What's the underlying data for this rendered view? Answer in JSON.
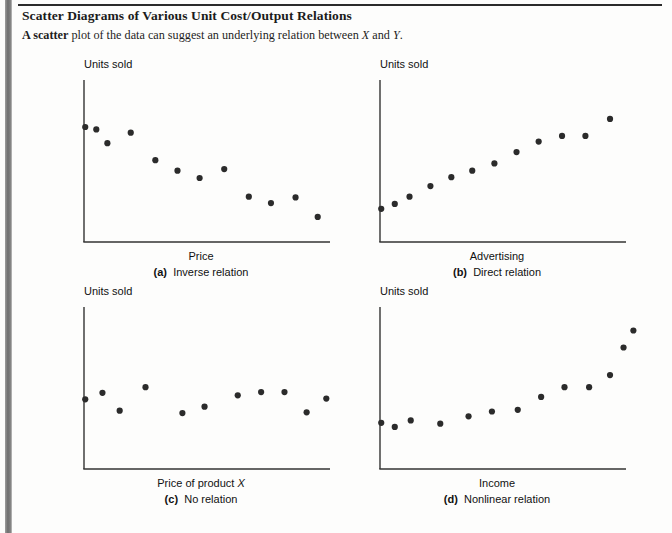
{
  "header": {
    "title": "Scatter Diagrams of Various Unit Cost/Output Relations",
    "subtitle_bold": "A scatter",
    "subtitle_rest_1": " plot of the data can suggest an underlying relation between ",
    "subtitle_var_x": "X",
    "subtitle_rest_2": " and ",
    "subtitle_var_y": "Y",
    "subtitle_end": "."
  },
  "charts": [
    {
      "key": "a",
      "panel_label": "(a)",
      "caption": "Inverse relation",
      "ylabel": "Units sold",
      "xlabel": "Price",
      "xlabel_italic_suffix": "",
      "chart_data": {
        "type": "scatter",
        "title": "(a) Inverse relation",
        "xlabel": "Price",
        "ylabel": "Units sold",
        "xlim": [
          0,
          100
        ],
        "ylim": [
          0,
          100
        ],
        "grid": false,
        "legend": "none",
        "points": [
          {
            "x": 0.5,
            "y": 71.0
          },
          {
            "x": 5.0,
            "y": 69.5
          },
          {
            "x": 9.5,
            "y": 61.0
          },
          {
            "x": 19.0,
            "y": 67.5
          },
          {
            "x": 29.0,
            "y": 50.5
          },
          {
            "x": 38.0,
            "y": 44.0
          },
          {
            "x": 47.0,
            "y": 39.5
          },
          {
            "x": 57.0,
            "y": 45.0
          },
          {
            "x": 67.0,
            "y": 28.0
          },
          {
            "x": 76.0,
            "y": 24.0
          },
          {
            "x": 86.0,
            "y": 27.5
          },
          {
            "x": 95.0,
            "y": 15.5
          }
        ]
      }
    },
    {
      "key": "b",
      "panel_label": "(b)",
      "caption": "Direct relation",
      "ylabel": "Units sold",
      "xlabel": "Advertising",
      "xlabel_italic_suffix": "",
      "chart_data": {
        "type": "scatter",
        "title": "(b) Direct relation",
        "xlabel": "Advertising",
        "ylabel": "Units sold",
        "xlim": [
          0,
          100
        ],
        "ylim": [
          0,
          100
        ],
        "grid": false,
        "legend": "none",
        "points": [
          {
            "x": 0.5,
            "y": 20.5
          },
          {
            "x": 6.0,
            "y": 23.5
          },
          {
            "x": 12.0,
            "y": 28.0
          },
          {
            "x": 20.5,
            "y": 34.5
          },
          {
            "x": 29.0,
            "y": 40.0
          },
          {
            "x": 37.5,
            "y": 44.0
          },
          {
            "x": 46.5,
            "y": 48.5
          },
          {
            "x": 55.5,
            "y": 55.5
          },
          {
            "x": 64.5,
            "y": 62.0
          },
          {
            "x": 74.0,
            "y": 65.5
          },
          {
            "x": 83.5,
            "y": 65.5
          },
          {
            "x": 93.5,
            "y": 76.0
          }
        ]
      }
    },
    {
      "key": "c",
      "panel_label": "(c)",
      "caption": "No relation",
      "ylabel": "Units sold",
      "xlabel": "Price of product ",
      "xlabel_italic_suffix": "X",
      "chart_data": {
        "type": "scatter",
        "title": "(c) No relation",
        "xlabel": "Price of product X",
        "ylabel": "Units sold",
        "xlim": [
          0,
          100
        ],
        "ylim": [
          0,
          100
        ],
        "grid": false,
        "legend": "none",
        "points": [
          {
            "x": 0.5,
            "y": 43.0
          },
          {
            "x": 7.5,
            "y": 47.0
          },
          {
            "x": 14.5,
            "y": 36.0
          },
          {
            "x": 25.0,
            "y": 50.5
          },
          {
            "x": 40.0,
            "y": 34.5
          },
          {
            "x": 49.0,
            "y": 38.5
          },
          {
            "x": 62.5,
            "y": 45.5
          },
          {
            "x": 72.0,
            "y": 47.5
          },
          {
            "x": 81.5,
            "y": 47.5
          },
          {
            "x": 90.5,
            "y": 35.0
          },
          {
            "x": 98.5,
            "y": 43.5
          }
        ]
      }
    },
    {
      "key": "d",
      "panel_label": "(d)",
      "caption": "Nonlinear relation",
      "ylabel": "Units sold",
      "xlabel": "Income",
      "xlabel_italic_suffix": "",
      "chart_data": {
        "type": "scatter",
        "title": "(d) Nonlinear relation",
        "xlabel": "Income",
        "ylabel": "Units sold",
        "xlim": [
          0,
          100
        ],
        "ylim": [
          0,
          100
        ],
        "grid": false,
        "legend": "none",
        "points": [
          {
            "x": 0.5,
            "y": 28.5
          },
          {
            "x": 6.0,
            "y": 26.0
          },
          {
            "x": 12.5,
            "y": 30.0
          },
          {
            "x": 24.5,
            "y": 28.0
          },
          {
            "x": 36.0,
            "y": 32.5
          },
          {
            "x": 45.5,
            "y": 35.5
          },
          {
            "x": 56.0,
            "y": 36.5
          },
          {
            "x": 65.5,
            "y": 44.5
          },
          {
            "x": 75.0,
            "y": 50.5
          },
          {
            "x": 85.0,
            "y": 50.5
          },
          {
            "x": 93.5,
            "y": 58.0
          },
          {
            "x": 99.0,
            "y": 75.0
          },
          {
            "x": 103.0,
            "y": 85.5
          }
        ]
      }
    }
  ],
  "style": {
    "dot_color": "#2b2b2b",
    "axis_color": "#333333",
    "text_color": "#111111"
  }
}
